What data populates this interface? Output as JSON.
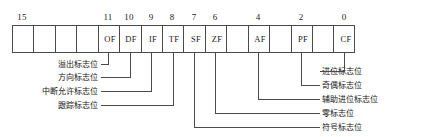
{
  "diagram": {
    "geometry": {
      "grid_left": 12,
      "grid_right": 355,
      "grid_top": 25,
      "grid_bottom": 53,
      "cell_count": 16,
      "line_color": "#4a4a4a",
      "text_color": "#141414"
    },
    "bit_numbers": [
      {
        "label": "15",
        "bit": 15
      },
      {
        "label": "11",
        "bit": 11
      },
      {
        "label": "10",
        "bit": 10
      },
      {
        "label": "9",
        "bit": 9
      },
      {
        "label": "8",
        "bit": 8
      },
      {
        "label": "7",
        "bit": 7
      },
      {
        "label": "6",
        "bit": 6
      },
      {
        "label": "4",
        "bit": 4
      },
      {
        "label": "2",
        "bit": 2
      },
      {
        "label": "0",
        "bit": 0
      }
    ],
    "cells": [
      {
        "bit": 15,
        "label": ""
      },
      {
        "bit": 14,
        "label": ""
      },
      {
        "bit": 13,
        "label": ""
      },
      {
        "bit": 12,
        "label": ""
      },
      {
        "bit": 11,
        "label": "OF"
      },
      {
        "bit": 10,
        "label": "DF"
      },
      {
        "bit": 9,
        "label": "IF"
      },
      {
        "bit": 8,
        "label": "TF"
      },
      {
        "bit": 7,
        "label": "SF"
      },
      {
        "bit": 6,
        "label": "ZF"
      },
      {
        "bit": 5,
        "label": ""
      },
      {
        "bit": 4,
        "label": "AF"
      },
      {
        "bit": 3,
        "label": ""
      },
      {
        "bit": 2,
        "label": "PF"
      },
      {
        "bit": 1,
        "label": ""
      },
      {
        "bit": 0,
        "label": "CF"
      }
    ],
    "left_notes": [
      {
        "text": "溢出标志位",
        "flag": "OF",
        "bit": 11
      },
      {
        "text": "方向标志位",
        "flag": "DF",
        "bit": 10
      },
      {
        "text": "中断允许标志位",
        "flag": "IF",
        "bit": 9
      },
      {
        "text": "跟踪标志位",
        "flag": "TF",
        "bit": 8
      }
    ],
    "right_notes": [
      {
        "text": "进位标志位",
        "flag": "CF",
        "bit": 0
      },
      {
        "text": "奇偶标志位",
        "flag": "PF",
        "bit": 2
      },
      {
        "text": "辅助进位标志位",
        "flag": "AF",
        "bit": 4
      },
      {
        "text": "零标志位",
        "flag": "ZF",
        "bit": 6
      },
      {
        "text": "符号标志位",
        "flag": "SF",
        "bit": 7
      }
    ]
  }
}
